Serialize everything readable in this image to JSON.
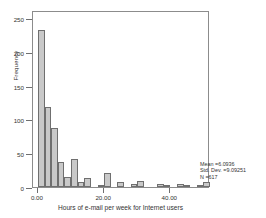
{
  "chart_data": {
    "type": "bar",
    "title": "",
    "xlabel": "Hours of e-mail per week for Internet users",
    "ylabel": "Frequency",
    "xlim": [
      -1.5,
      52
    ],
    "ylim": [
      0,
      262
    ],
    "grid": false,
    "legend": null,
    "bin_width": 2,
    "bar_color": "#c9c9c9",
    "bar_edge_color": "#6f6f6f",
    "x": [
      1,
      3,
      5,
      7,
      9,
      11,
      13,
      15,
      17,
      19,
      21,
      23,
      25,
      27,
      29,
      31,
      33,
      35,
      37,
      39,
      41,
      43,
      45,
      47,
      49,
      51
    ],
    "values": [
      233,
      118,
      87,
      37,
      15,
      41,
      7,
      14,
      0,
      1,
      21,
      0,
      8,
      0,
      4,
      9,
      0,
      0,
      4,
      1,
      0,
      4,
      1,
      0,
      1,
      7
    ],
    "xticks": [
      0,
      20,
      40
    ],
    "xtick_labels": [
      "0.00",
      "20.00",
      "40.00"
    ],
    "yticks": [
      0,
      50,
      100,
      150,
      200,
      250
    ],
    "ytick_labels": [
      "0",
      "50",
      "100",
      "150",
      "200",
      "250"
    ]
  },
  "annotation": {
    "mean_label": "Mean =6.0936",
    "stddev_label": "Std. Dev. =9.09251",
    "n_label": "N =617"
  }
}
